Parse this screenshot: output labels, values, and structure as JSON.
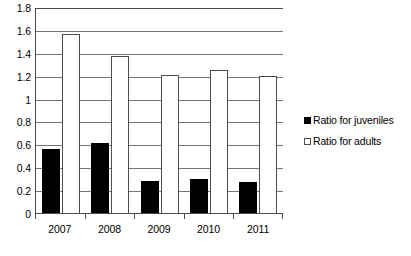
{
  "chart_data": {
    "type": "bar",
    "title": "",
    "subtitle": "",
    "xlabel": "",
    "ylabel": "",
    "categories": [
      "2007",
      "2008",
      "2009",
      "2010",
      "2011"
    ],
    "series": [
      {
        "name": "Ratio for juveniles",
        "color": "#000000",
        "fill": "solid-black",
        "values": [
          0.56,
          0.61,
          0.28,
          0.3,
          0.27
        ]
      },
      {
        "name": "Ratio for adults",
        "color": "#ffffff",
        "fill": "white-outline",
        "values": [
          1.56,
          1.37,
          1.21,
          1.25,
          1.2
        ]
      }
    ],
    "ylim": [
      0,
      1.8
    ],
    "y_ticks": [
      "0",
      "0.2",
      "0.4",
      "0.6",
      "0.8",
      "1",
      "1.2",
      "1.4",
      "1.6",
      "1.8"
    ],
    "y_tick_values": [
      0,
      0.2,
      0.4,
      0.6,
      0.8,
      1,
      1.2,
      1.4,
      1.6,
      1.8
    ],
    "grid": "horizontal",
    "legend_position": "right",
    "legend": [
      {
        "label": "Ratio for juveniles",
        "marker": "filled-square"
      },
      {
        "label": "Ratio for adults",
        "marker": "hollow-square"
      }
    ],
    "colors": {
      "juveniles": "#000000",
      "adults": "#ffffff",
      "axis": "#4d4d4d",
      "grid": "#737373",
      "background": "#ffffff"
    }
  }
}
